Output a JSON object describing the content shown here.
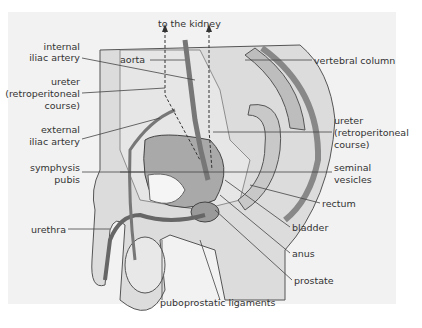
{
  "figure": {
    "background_color": "#f2f2f2",
    "labels": {
      "to_kidney": "to the kidney",
      "internal_iliac_1": "internal",
      "internal_iliac_2": "iliac artery",
      "aorta": "aorta",
      "ureter_left_1": "ureter",
      "ureter_left_2": "(retroperitoneal",
      "ureter_left_3": "course)",
      "external_iliac_1": "external",
      "external_iliac_2": "iliac artery",
      "symphysis_1": "symphysis",
      "symphysis_2": "pubis",
      "urethra": "urethra",
      "puboprostatic": "puboprostatic ligaments",
      "vertebral": "vertebral column",
      "ureter_right_1": "ureter",
      "ureter_right_2": "(retroperitoneal",
      "ureter_right_3": "course)",
      "seminal_1": "seminal",
      "seminal_2": "vesicles",
      "rectum": "rectum",
      "bladder": "bladder",
      "anus": "anus",
      "prostate": "prostate"
    }
  }
}
